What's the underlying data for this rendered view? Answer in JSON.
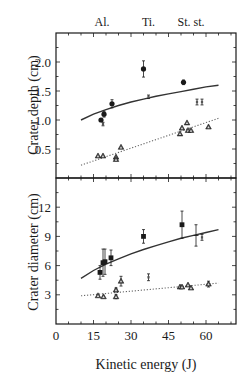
{
  "chart_data": [
    {
      "type": "scatter",
      "panel": "top",
      "ylabel": "Crater depth (cm)",
      "xlabel": "",
      "xlim": [
        0,
        72
      ],
      "ylim": [
        0,
        2.5
      ],
      "yticks": [
        0.5,
        1.0,
        1.5,
        2.0
      ],
      "ytick_labels": [
        "0.5",
        "1.0",
        "1.5",
        "2.0"
      ],
      "top_labels": [
        {
          "text": "Al.",
          "x": 18.4
        },
        {
          "text": "Ti.",
          "x": 37
        },
        {
          "text": "St. st.",
          "x": 54
        }
      ],
      "series": [
        {
          "name": "depth-large",
          "marker": "filled-circle",
          "points": [
            {
              "x": 18.0,
              "y": 1.0,
              "err": 0.0
            },
            {
              "x": 19.2,
              "y": 1.1,
              "err": 0.05
            },
            {
              "x": 22.4,
              "y": 1.28,
              "err": 0.07
            },
            {
              "x": 35.0,
              "y": 1.88,
              "err": 0.14
            },
            {
              "x": 51.0,
              "y": 1.65,
              "err": 0.04
            }
          ]
        },
        {
          "name": "depth-small-bar",
          "marker": "small-bar",
          "points": [
            {
              "x": 18.8,
              "y": 0.93,
              "err": 0.03
            },
            {
              "x": 37.0,
              "y": 1.4,
              "err": 0.03
            },
            {
              "x": 56.4,
              "y": 1.31,
              "err": 0.05
            },
            {
              "x": 58.4,
              "y": 1.31,
              "err": 0.05
            }
          ]
        },
        {
          "name": "depth-triangle",
          "marker": "triangle",
          "points": [
            {
              "x": 16.8,
              "y": 0.38
            },
            {
              "x": 18.8,
              "y": 0.38
            },
            {
              "x": 24.0,
              "y": 0.36
            },
            {
              "x": 24.0,
              "y": 0.32
            },
            {
              "x": 26.0,
              "y": 0.53
            },
            {
              "x": 49.6,
              "y": 0.76
            },
            {
              "x": 50.4,
              "y": 0.86
            },
            {
              "x": 52.4,
              "y": 0.95
            },
            {
              "x": 52.8,
              "y": 0.82
            },
            {
              "x": 54.0,
              "y": 0.82
            },
            {
              "x": 61.0,
              "y": 0.88
            }
          ]
        },
        {
          "name": "depth-fit-solid",
          "style": "solid",
          "x": [
            10,
            15,
            20,
            25,
            30,
            35,
            40,
            45,
            50,
            55,
            60,
            65
          ],
          "y": [
            1.0,
            1.1,
            1.18,
            1.25,
            1.31,
            1.36,
            1.41,
            1.45,
            1.49,
            1.53,
            1.57,
            1.6
          ]
        },
        {
          "name": "depth-fit-dotted",
          "style": "dotted",
          "x": [
            10,
            65
          ],
          "y": [
            0.22,
            1.03
          ]
        }
      ]
    },
    {
      "type": "scatter",
      "panel": "bottom",
      "ylabel": "Crater diameter (cm)",
      "xlabel": "Kinetic energy (J)",
      "xlim": [
        0,
        72
      ],
      "ylim": [
        0,
        15
      ],
      "xticks": [
        0,
        15,
        30,
        45,
        60
      ],
      "xtick_labels": [
        "0",
        "15",
        "30",
        "45",
        "60"
      ],
      "yticks": [
        3,
        6,
        9,
        12
      ],
      "ytick_labels": [
        "3",
        "6",
        "9",
        "12"
      ],
      "series": [
        {
          "name": "diameter-large",
          "marker": "filled-square",
          "points": [
            {
              "x": 17.6,
              "y": 5.3,
              "err": 0.7
            },
            {
              "x": 18.8,
              "y": 6.3,
              "err": 1.4
            },
            {
              "x": 19.6,
              "y": 6.4,
              "err": 1.3
            },
            {
              "x": 22.0,
              "y": 6.8,
              "err": 0.8
            },
            {
              "x": 35.0,
              "y": 9.0,
              "err": 0.7
            },
            {
              "x": 50.4,
              "y": 10.2,
              "err": 1.4
            }
          ]
        },
        {
          "name": "diameter-errorbar-only",
          "marker": "cross",
          "points": [
            {
              "x": 56.0,
              "y": 9.1,
              "err": 1.1
            }
          ]
        },
        {
          "name": "diameter-small-bar",
          "marker": "small-bar",
          "points": [
            {
              "x": 37.0,
              "y": 4.8,
              "err": 0.35
            },
            {
              "x": 58.4,
              "y": 8.9,
              "err": 0.3
            }
          ]
        },
        {
          "name": "diameter-triangle",
          "marker": "triangle",
          "points": [
            {
              "x": 16.8,
              "y": 2.9
            },
            {
              "x": 19.0,
              "y": 2.8
            },
            {
              "x": 24.0,
              "y": 3.5,
              "err": 0.2
            },
            {
              "x": 24.0,
              "y": 2.8,
              "err": 0.2
            },
            {
              "x": 26.0,
              "y": 4.4,
              "err": 0.5
            },
            {
              "x": 49.6,
              "y": 3.8
            },
            {
              "x": 50.4,
              "y": 3.8
            },
            {
              "x": 52.8,
              "y": 4.0
            },
            {
              "x": 54.0,
              "y": 3.7
            },
            {
              "x": 61.0,
              "y": 4.1,
              "err": 0.3
            }
          ]
        },
        {
          "name": "diameter-fit-solid",
          "style": "solid",
          "x": [
            10,
            15,
            20,
            25,
            30,
            35,
            40,
            45,
            50,
            55,
            60,
            65
          ],
          "y": [
            4.7,
            5.5,
            6.15,
            6.7,
            7.2,
            7.65,
            8.05,
            8.45,
            8.8,
            9.1,
            9.4,
            9.7
          ]
        },
        {
          "name": "diameter-fit-dotted",
          "style": "dotted",
          "x": [
            10,
            65
          ],
          "y": [
            2.9,
            4.2
          ]
        }
      ]
    }
  ]
}
